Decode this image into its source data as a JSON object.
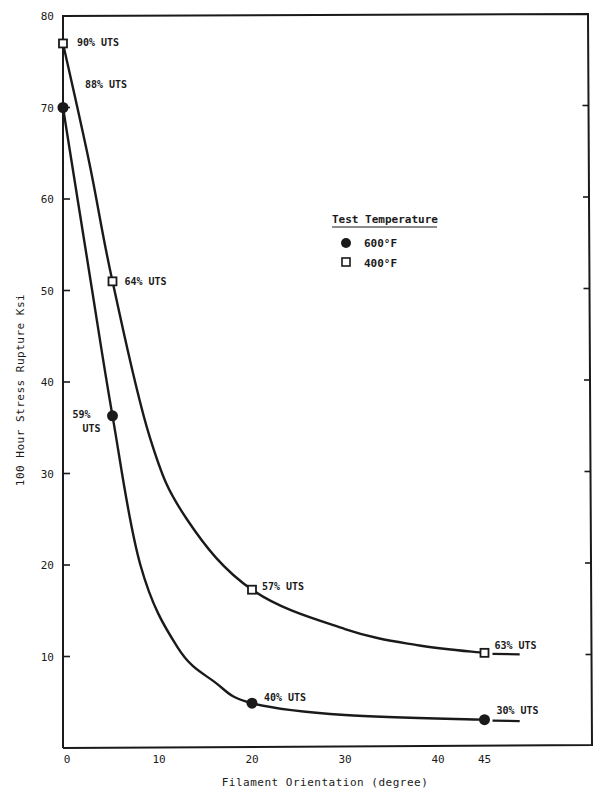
{
  "chart_data": {
    "type": "line",
    "title": "",
    "xlabel": "Filament Orientation (degree)",
    "ylabel": "100 Hour Stress Rupture Ksi",
    "xlim": [
      0,
      55
    ],
    "ylim": [
      0,
      80
    ],
    "x_ticks": [
      0,
      10,
      20,
      30,
      40,
      45
    ],
    "y_ticks": [
      10,
      20,
      30,
      40,
      50,
      60,
      70,
      80
    ],
    "grid": false,
    "legend": {
      "title": "Test Temperature",
      "position": "upper-right-center",
      "entries": [
        {
          "label": "600°F",
          "marker": "filled-circle"
        },
        {
          "label": "400°F",
          "marker": "open-square"
        }
      ]
    },
    "series": [
      {
        "name": "400°F",
        "marker": "open-square",
        "x": [
          0,
          5,
          20,
          45
        ],
        "y": [
          77,
          51,
          17.3,
          10.4
        ],
        "annotations": [
          "90% UTS",
          "64% UTS",
          "57% UTS",
          "63% UTS"
        ],
        "curve_end_x": 49
      },
      {
        "name": "600°F",
        "marker": "filled-circle",
        "x": [
          0,
          5,
          20,
          45
        ],
        "y": [
          70,
          36.3,
          4.9,
          3.1
        ],
        "annotations": [
          "88% UTS",
          "59% UTS",
          "40% UTS",
          "30% UTS"
        ],
        "curve_end_x": 49
      }
    ]
  },
  "colors": {
    "ink": "#1a1a1a",
    "background": "#ffffff"
  }
}
